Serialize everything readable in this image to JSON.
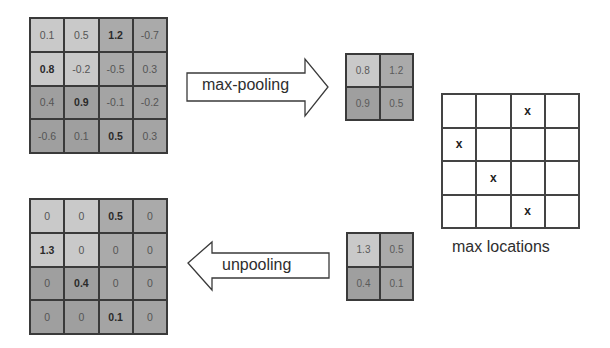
{
  "colors": {
    "light": "#c9c9c9",
    "mid": "#aaaaaa",
    "dark_a": "#9f9f9f",
    "dark_b": "#a4a4a4",
    "line": "#3a3a3a"
  },
  "input_grid": {
    "rows": [
      [
        {
          "v": "0.1",
          "b": false
        },
        {
          "v": "0.5",
          "b": false
        },
        {
          "v": "1.2",
          "b": true
        },
        {
          "v": "-0.7",
          "b": false
        }
      ],
      [
        {
          "v": "0.8",
          "b": true
        },
        {
          "v": "-0.2",
          "b": false
        },
        {
          "v": "-0.5",
          "b": false
        },
        {
          "v": "0.3",
          "b": false
        }
      ],
      [
        {
          "v": "0.4",
          "b": false
        },
        {
          "v": "0.9",
          "b": true
        },
        {
          "v": "-0.1",
          "b": false
        },
        {
          "v": "-0.2",
          "b": false
        }
      ],
      [
        {
          "v": "-0.6",
          "b": false
        },
        {
          "v": "0.1",
          "b": false
        },
        {
          "v": "0.5",
          "b": true
        },
        {
          "v": "0.3",
          "b": false
        }
      ]
    ]
  },
  "maxpool_arrow": {
    "label": "max-pooling",
    "direction": "right"
  },
  "pooled_grid": {
    "rows": [
      [
        "0.8",
        "1.2"
      ],
      [
        "0.9",
        "0.5"
      ]
    ]
  },
  "max_locations": {
    "label": "max locations",
    "marker": "x",
    "rows": [
      [
        "",
        "",
        "x",
        ""
      ],
      [
        "x",
        "",
        "",
        ""
      ],
      [
        "",
        "x",
        "",
        ""
      ],
      [
        "",
        "",
        "x",
        ""
      ]
    ]
  },
  "unpool_arrow": {
    "label": "unpooling",
    "direction": "left"
  },
  "unpool_input_grid": {
    "rows": [
      [
        "1.3",
        "0.5"
      ],
      [
        "0.4",
        "0.1"
      ]
    ]
  },
  "output_grid": {
    "rows": [
      [
        {
          "v": "0",
          "b": false
        },
        {
          "v": "0",
          "b": false
        },
        {
          "v": "0.5",
          "b": true
        },
        {
          "v": "0",
          "b": false
        }
      ],
      [
        {
          "v": "1.3",
          "b": true
        },
        {
          "v": "0",
          "b": false
        },
        {
          "v": "0",
          "b": false
        },
        {
          "v": "0",
          "b": false
        }
      ],
      [
        {
          "v": "0",
          "b": false
        },
        {
          "v": "0.4",
          "b": true
        },
        {
          "v": "0",
          "b": false
        },
        {
          "v": "0",
          "b": false
        }
      ],
      [
        {
          "v": "0",
          "b": false
        },
        {
          "v": "0",
          "b": false
        },
        {
          "v": "0.1",
          "b": true
        },
        {
          "v": "0",
          "b": false
        }
      ]
    ]
  }
}
